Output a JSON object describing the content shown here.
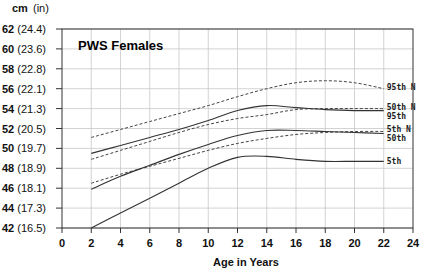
{
  "chart_data": {
    "type": "line",
    "title": "PWS Females",
    "xlabel": "Age in Years",
    "ylabel": "cm (in)",
    "unit_header": {
      "cm": "cm",
      "in": "(in)"
    },
    "xlim": [
      0,
      24
    ],
    "ylim": [
      42,
      62
    ],
    "grid": true,
    "x_ticks": [
      0,
      2,
      4,
      6,
      8,
      10,
      12,
      14,
      16,
      18,
      20,
      22,
      24
    ],
    "y_ticks": [
      {
        "cm": 62,
        "in": "(24.4)"
      },
      {
        "cm": 60,
        "in": "(23.6)"
      },
      {
        "cm": 58,
        "in": "(22.8)"
      },
      {
        "cm": 56,
        "in": "(22.1)"
      },
      {
        "cm": 54,
        "in": "(21.3)"
      },
      {
        "cm": 52,
        "in": "(20.5)"
      },
      {
        "cm": 50,
        "in": "(19.7)"
      },
      {
        "cm": 48,
        "in": "(18.9)"
      },
      {
        "cm": 46,
        "in": "(18.1)"
      },
      {
        "cm": 44,
        "in": "(17.3)"
      },
      {
        "cm": 42,
        "in": "(16.5)"
      }
    ],
    "x": [
      2,
      4,
      6,
      8,
      10,
      12,
      14,
      16,
      18,
      20,
      22
    ],
    "series": [
      {
        "name": "95th N",
        "style": "dashed",
        "values": [
          51.1,
          51.9,
          52.7,
          53.5,
          54.3,
          55.2,
          56.0,
          56.6,
          56.8,
          56.6,
          56.0
        ],
        "label_y": 56.2
      },
      {
        "name": "50th N",
        "style": "dashed",
        "values": [
          48.9,
          49.8,
          50.7,
          51.6,
          52.4,
          53.0,
          53.4,
          53.9,
          54.0,
          54.0,
          54.0
        ],
        "label_y": 54.2
      },
      {
        "name": "95th",
        "style": "solid",
        "values": [
          49.5,
          50.3,
          51.1,
          51.9,
          52.8,
          53.8,
          54.3,
          54.1,
          53.9,
          53.8,
          53.8
        ],
        "label_y": 53.3
      },
      {
        "name": "5th N",
        "style": "dashed",
        "values": [
          46.5,
          47.4,
          48.2,
          49.0,
          49.8,
          50.5,
          51.0,
          51.4,
          51.6,
          51.7,
          51.7
        ],
        "label_y": 51.9
      },
      {
        "name": "50th",
        "style": "solid",
        "values": [
          45.9,
          47.2,
          48.3,
          49.4,
          50.4,
          51.3,
          51.8,
          51.8,
          51.7,
          51.6,
          51.5
        ],
        "label_y": 51.0
      },
      {
        "name": "5th",
        "style": "solid",
        "values": [
          42.0,
          43.5,
          45.0,
          46.5,
          48.0,
          49.1,
          49.2,
          48.9,
          48.7,
          48.7,
          48.7
        ],
        "label_y": 48.7
      }
    ]
  }
}
